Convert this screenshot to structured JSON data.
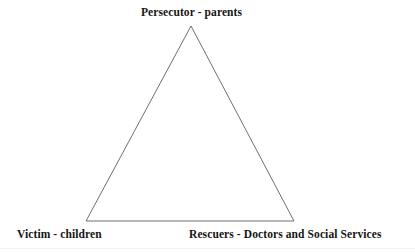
{
  "diagram": {
    "type": "triangle-diagram",
    "background_color": "#ffffff",
    "line_color": "#6f6f6f",
    "text_color": "#151515",
    "nodes": [
      {
        "id": "persecutor",
        "role": "Persecutor",
        "actors": "parents",
        "label": "Persecutor - parents",
        "position": "apex-top",
        "vertex": {
          "x": 191,
          "y": 26
        }
      },
      {
        "id": "victim",
        "role": "Victim",
        "actors": "children",
        "label": "Victim - children",
        "position": "bottom-left",
        "vertex": {
          "x": 86,
          "y": 221
        }
      },
      {
        "id": "rescuers",
        "role": "Rescuers",
        "actors": "Doctors and Social Services",
        "label": "Rescuers - Doctors and Social Services",
        "position": "bottom-right",
        "vertex": {
          "x": 294,
          "y": 221
        }
      }
    ],
    "edges": [
      {
        "id": "edge-left",
        "from": "persecutor",
        "to": "victim"
      },
      {
        "id": "edge-right",
        "from": "persecutor",
        "to": "rescuers"
      },
      {
        "id": "edge-base",
        "from": "victim",
        "to": "rescuers"
      }
    ]
  }
}
